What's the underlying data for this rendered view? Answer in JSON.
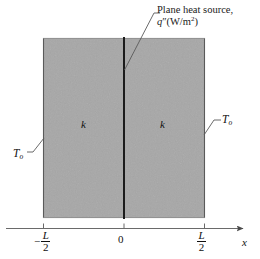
{
  "figure": {
    "background_color": "#ffffff",
    "slab_fill_color": "#b2b2b2",
    "line_color": "#4a4a4a",
    "text_color": "#111111"
  },
  "annotations": {
    "heat_source": {
      "line1": "Plane heat source,",
      "symbol": "q",
      "prime": "″",
      "units_open": "(W/m",
      "units_exponent": "2",
      "units_close": ")"
    },
    "conductivity_left": "k",
    "conductivity_right": "k",
    "surface_temp_left": {
      "symbol": "T",
      "subscript": "o"
    },
    "surface_temp_right": {
      "symbol": "T",
      "subscript": "o"
    }
  },
  "axis": {
    "name": "x",
    "ticks": [
      {
        "id": "neg-half-L",
        "sign": "−",
        "numerator": "L",
        "denominator": "2",
        "value": "-L/2"
      },
      {
        "id": "origin",
        "label": "0",
        "value": "0"
      },
      {
        "id": "pos-half-L",
        "sign": "",
        "numerator": "L",
        "denominator": "2",
        "value": "L/2"
      }
    ]
  },
  "geometry": {
    "slab_left_x": 43,
    "slab_right_x": 205,
    "slab_top_y": 38,
    "slab_bottom_y": 218,
    "center_x": 124,
    "axis_y": 228,
    "axis_start_x": 6,
    "axis_end_x": 247
  }
}
